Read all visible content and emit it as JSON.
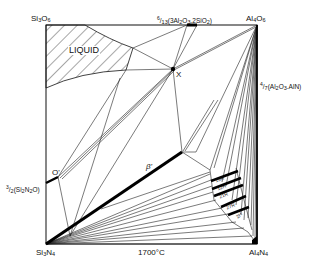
{
  "diagram": {
    "temperature": "1700°C",
    "corners": {
      "top_left": "Si3O6",
      "top_right": "Al4O6",
      "bottom_left": "Si3N4",
      "bottom_right": "Al4N4"
    },
    "edge_labels": {
      "mullite": "6/13(3Al2O3.2SiO2)",
      "alon": "4/7(Al2O3.AlN)",
      "sialon_o": "3/2(Si2N2O)"
    },
    "regions": {
      "liquid": "LIQUID",
      "beta_prime": "β'",
      "o_prime": "O'",
      "x_phase": "X"
    },
    "polytypoids": [
      "15R",
      "12H",
      "21R",
      "27R",
      "2H"
    ]
  }
}
